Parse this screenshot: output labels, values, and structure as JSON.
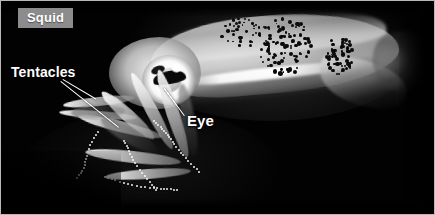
{
  "figure": {
    "kind": "labeled-photograph",
    "subject": "squid",
    "background_color": "#000000",
    "border_color": "#b9b9b9"
  },
  "title_badge": {
    "text": "Squid",
    "background_color": "#8c8c8c",
    "text_color": "#ffffff"
  },
  "annotations": [
    {
      "id": "tentacles",
      "label": "Tentacles",
      "text_color": "#ffffff",
      "leader_lines": 2
    },
    {
      "id": "eye",
      "label": "Eye",
      "text_color": "#ffffff",
      "leader_lines": 1
    }
  ],
  "labels": {
    "tentacles": "Tentacles",
    "eye": "Eye"
  }
}
